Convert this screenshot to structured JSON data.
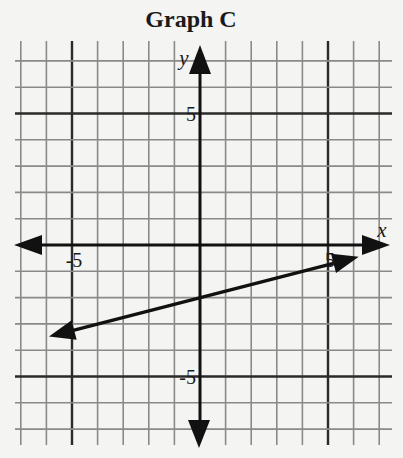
{
  "title": "Graph C",
  "axes": {
    "x_label": "x",
    "y_label": "y",
    "x_ticks": [
      {
        "value": -5,
        "label": "-5"
      },
      {
        "value": 5,
        "label": "5"
      }
    ],
    "y_ticks": [
      {
        "value": 5,
        "label": "5"
      },
      {
        "value": -5,
        "label": "-5"
      }
    ]
  },
  "colors": {
    "background": "#f4f4f2",
    "grid": "#8a8a8a",
    "major_grid": "#2a2a2a",
    "axis": "#111111",
    "line": "#111111"
  },
  "chart_data": {
    "type": "line",
    "title": "Graph C",
    "xlabel": "x",
    "ylabel": "y",
    "xlim": [
      -7,
      7
    ],
    "ylim": [
      -7,
      7
    ],
    "grid": true,
    "grid_step": 1,
    "major_grid_step": 5,
    "tick_labels": {
      "x": [
        "-5",
        "5"
      ],
      "y": [
        "5",
        "-5"
      ]
    },
    "series": [
      {
        "name": "line",
        "equation": "y = 0.25x - 2",
        "slope": 0.25,
        "y_intercept": -2,
        "arrows_both_ends": true,
        "x": [
          -5.9,
          -4,
          0,
          4,
          6.2
        ],
        "y": [
          -3.48,
          -3,
          -2,
          -1,
          -0.45
        ]
      }
    ],
    "legend": null
  }
}
